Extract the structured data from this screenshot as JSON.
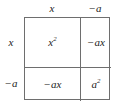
{
  "diagram": {
    "type": "area-model-grid",
    "border_color": "#6e6e6e",
    "background_color": "#ffffff",
    "text_color": "#1c1c1c"
  },
  "column_headers": [
    {
      "text": "x",
      "base": "x",
      "exponent": ""
    },
    {
      "text": "−a",
      "base": "−a",
      "exponent": ""
    }
  ],
  "row_headers": [
    {
      "text": "x",
      "base": "x",
      "exponent": ""
    },
    {
      "text": "−a",
      "base": "−a",
      "exponent": ""
    }
  ],
  "cells": [
    {
      "position": "top-left",
      "text": "x2",
      "base": "x",
      "exponent": "2"
    },
    {
      "position": "top-right",
      "text": "−ax",
      "base": "−ax",
      "exponent": ""
    },
    {
      "position": "bottom-left",
      "text": "−ax",
      "base": "−ax",
      "exponent": ""
    },
    {
      "position": "bottom-right",
      "text": "a2",
      "base": "a",
      "exponent": "2"
    }
  ]
}
